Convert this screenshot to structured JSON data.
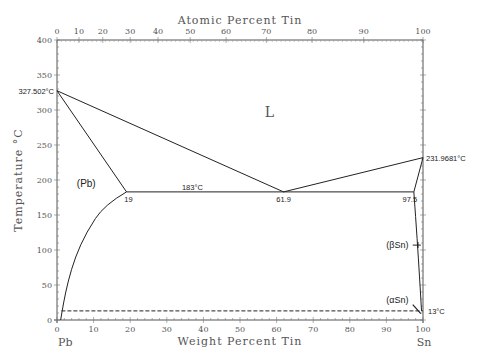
{
  "chart_data": {
    "type": "line",
    "xlabel": "Weight Percent Tin",
    "x2label": "Atomic Percent Tin",
    "ylabel": "Temperature °C",
    "xlim": [
      0,
      100
    ],
    "ylim": [
      0,
      400
    ],
    "x_ticks": [
      0,
      10,
      20,
      30,
      40,
      50,
      60,
      70,
      80,
      90,
      100
    ],
    "y_ticks": [
      0,
      50,
      100,
      150,
      200,
      250,
      300,
      350,
      400
    ],
    "atomic_ticks": [
      {
        "label": "0",
        "wt": 0
      },
      {
        "label": "10",
        "wt": 6
      },
      {
        "label": "20",
        "wt": 12.5
      },
      {
        "label": "30",
        "wt": 20
      },
      {
        "label": "40",
        "wt": 27.6
      },
      {
        "label": "50",
        "wt": 36.4
      },
      {
        "label": "60",
        "wt": 46.2
      },
      {
        "label": "70",
        "wt": 57.2
      },
      {
        "label": "80",
        "wt": 69.7
      },
      {
        "label": "90",
        "wt": 83.8
      },
      {
        "label": "100",
        "wt": 100
      }
    ],
    "left_element": "Pb",
    "right_element": "Sn",
    "series": [
      {
        "name": "liquidus-left",
        "points": [
          [
            0,
            327.502
          ],
          [
            61.9,
            183
          ]
        ]
      },
      {
        "name": "liquidus-right",
        "points": [
          [
            61.9,
            183
          ],
          [
            100,
            231.9681
          ]
        ]
      },
      {
        "name": "solidus-pb",
        "points": [
          [
            0,
            327.502
          ],
          [
            19,
            183
          ]
        ]
      },
      {
        "name": "eutectic",
        "points": [
          [
            19,
            183
          ],
          [
            97.5,
            183
          ]
        ]
      },
      {
        "name": "solvus-pb",
        "points": [
          [
            19,
            183
          ],
          [
            13,
            165
          ],
          [
            8,
            125
          ],
          [
            5,
            90
          ],
          [
            3,
            55
          ],
          [
            1.8,
            25
          ],
          [
            1,
            0
          ]
        ]
      },
      {
        "name": "solidus-sn",
        "points": [
          [
            97.5,
            183
          ],
          [
            100,
            231.9681
          ]
        ]
      },
      {
        "name": "solvus-sn",
        "points": [
          [
            97.5,
            183
          ],
          [
            98.5,
            110
          ],
          [
            99.6,
            13
          ]
        ]
      },
      {
        "name": "allotropic",
        "style": "dashed",
        "points": [
          [
            1.2,
            13
          ],
          [
            100,
            13
          ]
        ]
      }
    ],
    "annotations": [
      {
        "text": "327.502°C",
        "wt": 0,
        "t": 327.502
      },
      {
        "text": "231.9681°C",
        "wt": 100,
        "t": 231.9681
      },
      {
        "text": "183°C",
        "wt": 37,
        "t": 183
      },
      {
        "text": "19",
        "wt": 19,
        "t": 183
      },
      {
        "text": "61.9",
        "wt": 61.9,
        "t": 183
      },
      {
        "text": "97.5",
        "wt": 97.5,
        "t": 183
      },
      {
        "text": "13°C",
        "wt": 100,
        "t": 13
      },
      {
        "text": "L",
        "wt": 58,
        "t": 290
      },
      {
        "text": "(Pb)",
        "wt": 8,
        "t": 190
      },
      {
        "text": "(βSn)",
        "wt": 93,
        "t": 107
      },
      {
        "text": "(αSn)",
        "wt": 93,
        "t": 28
      }
    ]
  }
}
